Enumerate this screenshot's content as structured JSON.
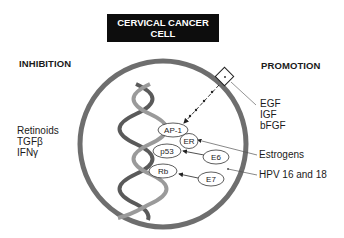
{
  "title": {
    "line1": "CERVICAL CANCER",
    "line2": "CELL"
  },
  "inhibition": {
    "heading": "INHIBITION",
    "items": [
      "Retinoids",
      "TGFβ",
      "IFNγ"
    ]
  },
  "promotion": {
    "heading": "PROMOTION",
    "growth_factors": [
      "EGF",
      "IGF",
      "bFGF"
    ],
    "estrogens": "Estrogens",
    "hpv": "HPV 16 and 18"
  },
  "cell": {
    "nodes": {
      "ap1": "AP-1",
      "er": "ER",
      "p53": "p53",
      "e6": "E6",
      "rb": "Rb",
      "e7": "E7"
    },
    "membrane_color": "#6e6e6e",
    "receptor_icon": "receptor-box-icon",
    "dna_icon": "dna-helix-icon"
  }
}
